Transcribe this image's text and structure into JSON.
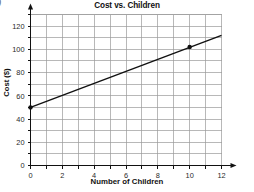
{
  "corner_glyph": ")",
  "chart_data": {
    "type": "line",
    "title": "Cost vs. Children",
    "xlabel": "Number of Children",
    "ylabel": "Cost ($)",
    "xlim": [
      0,
      12
    ],
    "ylim": [
      0,
      130
    ],
    "x_major_ticks": [
      0,
      2,
      4,
      6,
      8,
      10,
      12
    ],
    "x_major_tick_labels": [
      "0",
      "2",
      "4",
      "6",
      "8",
      "10",
      "12"
    ],
    "x_minor_ticks": [
      1,
      3,
      5,
      7,
      9,
      11
    ],
    "y_major_ticks": [
      0,
      20,
      40,
      60,
      80,
      100,
      120
    ],
    "y_major_tick_labels": [
      "0",
      "20",
      "40",
      "60",
      "80",
      "100",
      "120"
    ],
    "y_minor_ticks": [
      10,
      30,
      50,
      70,
      90,
      110,
      130
    ],
    "grid": true,
    "grid_color": "#9a9a9a",
    "legend": "none",
    "line_color": "#111111",
    "series": [
      {
        "name": "Cost",
        "x": [
          0,
          12
        ],
        "y": [
          50,
          112
        ],
        "slope": 5.2,
        "intercept": 50
      }
    ],
    "markers": [
      {
        "label": "y-intercept",
        "x": 0,
        "y": 50
      },
      {
        "label": "plotted-point",
        "x": 10,
        "y": 102
      }
    ]
  }
}
